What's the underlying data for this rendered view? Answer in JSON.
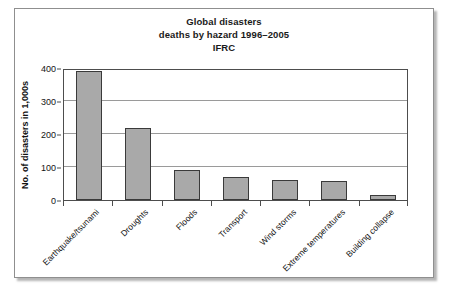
{
  "chart_data": {
    "type": "bar",
    "title": "Global disasters deaths by hazard 1996–2005 IFRC",
    "title_lines": [
      "Global disasters",
      "deaths by hazard 1996–2005",
      "IFRC"
    ],
    "xlabel": "",
    "ylabel": "No. of disasters in 1,000s",
    "ylim": [
      0,
      400
    ],
    "yticks": [
      0,
      100,
      200,
      300,
      400
    ],
    "ytick_labels": [
      "0",
      "100",
      "200",
      "300",
      "400"
    ],
    "grid": true,
    "legend": false,
    "legend_position": "none",
    "categories": [
      "Earthquake/tsunami",
      "Droughts",
      "Floods",
      "Transport",
      "Wind storms",
      "Extreme temperatures",
      "Building collapse"
    ],
    "values": [
      390,
      219,
      90,
      69,
      61,
      59,
      15
    ],
    "bar_color": "#a9a9a9",
    "bar_edge_color": "#3a3a3a"
  },
  "figure": {
    "frame_color": "#8f8f8f",
    "background": "#ffffff",
    "axis_color": "#4d4d4d",
    "gridline_color": "#9a9a9a",
    "text_color": "#141414"
  }
}
